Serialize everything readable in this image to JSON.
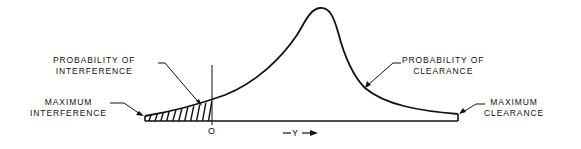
{
  "diagram": {
    "type": "distribution-curve",
    "curve_color": "#111111",
    "background": "#ffffff",
    "labels": {
      "probability_of_interference": [
        "PROBABILITY OF",
        "INTERFERENCE"
      ],
      "maximum_interference": [
        "MAXIMUM",
        "INTERFERENCE"
      ],
      "probability_of_clearance": [
        "PROBABILITY OF",
        "CLEARANCE"
      ],
      "maximum_clearance": [
        "MAXIMUM",
        "CLEARANCE"
      ]
    },
    "axis": {
      "origin_label": "O",
      "variable_label": "Y"
    },
    "regions": {
      "interference": "hatched region left of origin",
      "clearance": "region right of origin under curve"
    }
  }
}
